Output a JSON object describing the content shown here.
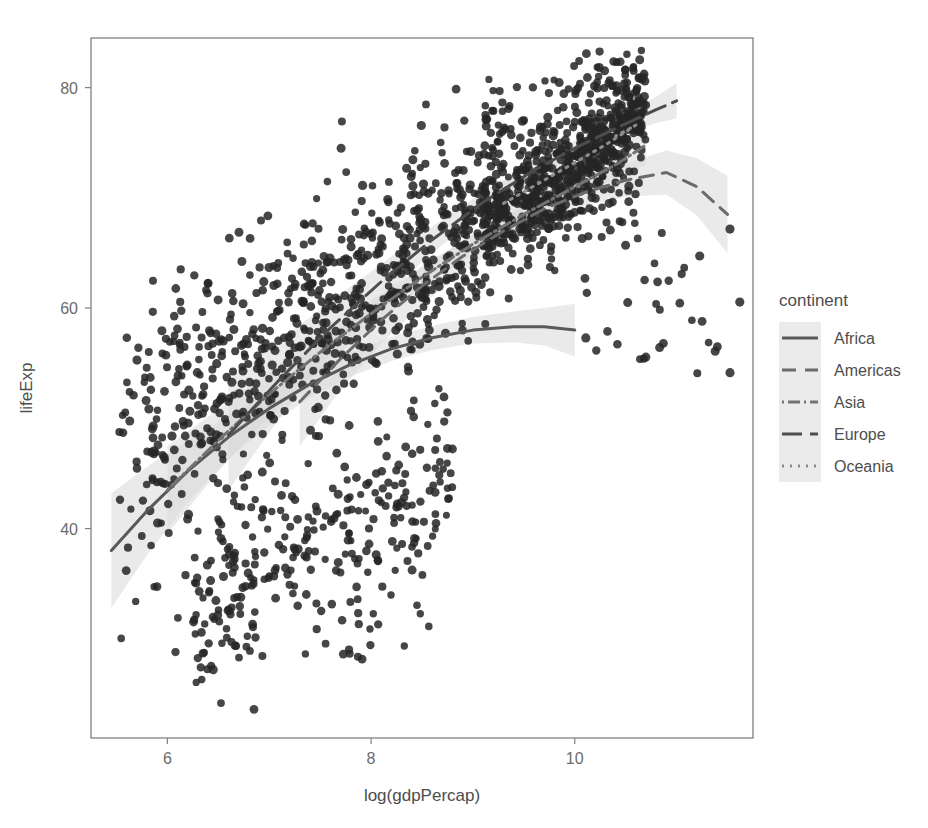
{
  "chart_data": {
    "type": "scatter",
    "title": "",
    "subtitle": "",
    "xlabel": "log(gdpPercap)",
    "ylabel": "lifeExp",
    "xlim": [
      5.25,
      11.75
    ],
    "ylim": [
      21.0,
      84.5
    ],
    "xticks": [
      6,
      8,
      10
    ],
    "yticks": [
      40,
      60,
      80
    ],
    "xtick_labels": [
      "6",
      "8",
      "10"
    ],
    "ytick_labels": [
      "40",
      "60",
      "80"
    ],
    "grid": false,
    "panel_background": "#ffffff",
    "panel_border_color": "#808080",
    "point_color": "#262626",
    "point_size": 7,
    "point_opacity": 0.85,
    "ribbon_color": "#d9d9d9",
    "ribbon_opacity": 0.55,
    "legend": {
      "title": "continent",
      "position": "right",
      "entries": [
        {
          "label": "Africa",
          "linetype": "solid",
          "dasharray": "none",
          "color": "#595959"
        },
        {
          "label": "Americas",
          "linetype": "dashed",
          "dasharray": "14,9",
          "color": "#6b6b6b"
        },
        {
          "label": "Asia",
          "linetype": "dotdash",
          "dasharray": "2,4,12,4",
          "color": "#737373"
        },
        {
          "label": "Europe",
          "linetype": "longdash",
          "dasharray": "20,8",
          "color": "#4d4d4d"
        },
        {
          "label": "Oceania",
          "linetype": "dotted",
          "dasharray": "2,6",
          "color": "#8c8c8c"
        }
      ]
    },
    "series": [
      {
        "name": "Africa",
        "linetype": "solid",
        "color": "#595959",
        "smooth": [
          {
            "x": 5.45,
            "y": 38.0,
            "lo": 32.8,
            "hi": 43.2
          },
          {
            "x": 5.8,
            "y": 41.6,
            "lo": 37.6,
            "hi": 45.6
          },
          {
            "x": 6.2,
            "y": 45.2,
            "lo": 42.4,
            "hi": 48.0
          },
          {
            "x": 6.6,
            "y": 48.3,
            "lo": 46.3,
            "hi": 50.3
          },
          {
            "x": 7.0,
            "y": 50.9,
            "lo": 49.4,
            "hi": 52.4
          },
          {
            "x": 7.4,
            "y": 53.1,
            "lo": 51.9,
            "hi": 54.3
          },
          {
            "x": 7.8,
            "y": 54.9,
            "lo": 53.8,
            "hi": 56.0
          },
          {
            "x": 8.2,
            "y": 56.3,
            "lo": 55.2,
            "hi": 57.4
          },
          {
            "x": 8.6,
            "y": 57.3,
            "lo": 56.2,
            "hi": 58.4
          },
          {
            "x": 9.0,
            "y": 58.0,
            "lo": 56.8,
            "hi": 59.2
          },
          {
            "x": 9.4,
            "y": 58.3,
            "lo": 56.9,
            "hi": 59.7
          },
          {
            "x": 9.7,
            "y": 58.3,
            "lo": 56.6,
            "hi": 60.0
          },
          {
            "x": 10.0,
            "y": 58.0,
            "lo": 55.6,
            "hi": 60.4
          }
        ]
      },
      {
        "name": "Americas",
        "linetype": "dashed",
        "color": "#6b6b6b",
        "smooth": [
          {
            "x": 7.3,
            "y": 51.5,
            "lo": 47.5,
            "hi": 55.5
          },
          {
            "x": 7.7,
            "y": 55.4,
            "lo": 52.6,
            "hi": 58.2
          },
          {
            "x": 8.1,
            "y": 58.9,
            "lo": 56.8,
            "hi": 61.0
          },
          {
            "x": 8.5,
            "y": 62.0,
            "lo": 60.3,
            "hi": 63.7
          },
          {
            "x": 8.9,
            "y": 64.7,
            "lo": 63.3,
            "hi": 66.1
          },
          {
            "x": 9.3,
            "y": 67.0,
            "lo": 65.8,
            "hi": 68.2
          },
          {
            "x": 9.7,
            "y": 69.0,
            "lo": 67.9,
            "hi": 70.1
          },
          {
            "x": 10.1,
            "y": 70.5,
            "lo": 69.3,
            "hi": 71.7
          },
          {
            "x": 10.5,
            "y": 71.6,
            "lo": 70.1,
            "hi": 73.1
          },
          {
            "x": 10.9,
            "y": 72.3,
            "lo": 70.3,
            "hi": 74.3
          },
          {
            "x": 11.2,
            "y": 71.0,
            "lo": 68.4,
            "hi": 73.6
          },
          {
            "x": 11.5,
            "y": 68.5,
            "lo": 65.0,
            "hi": 72.0
          }
        ]
      },
      {
        "name": "Asia",
        "linetype": "dotdash",
        "color": "#737373",
        "smooth": [
          {
            "x": 6.0,
            "y": 43.5,
            "lo": 39.5,
            "hi": 47.5
          },
          {
            "x": 6.5,
            "y": 48.0,
            "lo": 45.2,
            "hi": 50.8
          },
          {
            "x": 7.0,
            "y": 52.2,
            "lo": 50.2,
            "hi": 54.2
          },
          {
            "x": 7.5,
            "y": 56.0,
            "lo": 54.5,
            "hi": 57.5
          },
          {
            "x": 8.0,
            "y": 59.5,
            "lo": 58.3,
            "hi": 60.7
          },
          {
            "x": 8.5,
            "y": 62.8,
            "lo": 61.8,
            "hi": 63.8
          },
          {
            "x": 9.0,
            "y": 65.8,
            "lo": 64.9,
            "hi": 66.7
          },
          {
            "x": 9.5,
            "y": 68.5,
            "lo": 67.6,
            "hi": 69.4
          },
          {
            "x": 10.0,
            "y": 71.0,
            "lo": 70.0,
            "hi": 72.0
          },
          {
            "x": 10.4,
            "y": 73.0,
            "lo": 71.7,
            "hi": 74.3
          },
          {
            "x": 10.7,
            "y": 74.8,
            "lo": 73.0,
            "hi": 76.6
          }
        ]
      },
      {
        "name": "Europe",
        "linetype": "longdash",
        "color": "#4d4d4d",
        "smooth": [
          {
            "x": 6.6,
            "y": 48.5,
            "lo": 43.5,
            "hi": 53.5
          },
          {
            "x": 7.1,
            "y": 53.5,
            "lo": 50.0,
            "hi": 57.0
          },
          {
            "x": 7.6,
            "y": 58.2,
            "lo": 55.8,
            "hi": 60.6
          },
          {
            "x": 8.1,
            "y": 62.4,
            "lo": 60.8,
            "hi": 64.0
          },
          {
            "x": 8.6,
            "y": 66.2,
            "lo": 65.0,
            "hi": 67.4
          },
          {
            "x": 9.1,
            "y": 69.6,
            "lo": 68.7,
            "hi": 70.5
          },
          {
            "x": 9.6,
            "y": 72.5,
            "lo": 71.7,
            "hi": 73.3
          },
          {
            "x": 10.0,
            "y": 74.5,
            "lo": 73.8,
            "hi": 75.2
          },
          {
            "x": 10.4,
            "y": 76.3,
            "lo": 75.5,
            "hi": 77.1
          },
          {
            "x": 10.8,
            "y": 78.0,
            "lo": 76.8,
            "hi": 79.2
          },
          {
            "x": 11.0,
            "y": 78.8,
            "lo": 77.2,
            "hi": 80.4
          }
        ]
      },
      {
        "name": "Oceania",
        "linetype": "dotted",
        "color": "#8c8c8c",
        "smooth": [
          {
            "x": 9.3,
            "y": 69.5,
            "lo": 67.5,
            "hi": 71.5
          },
          {
            "x": 9.7,
            "y": 71.6,
            "lo": 70.4,
            "hi": 72.8
          },
          {
            "x": 10.0,
            "y": 73.2,
            "lo": 72.3,
            "hi": 74.1
          },
          {
            "x": 10.3,
            "y": 74.8,
            "lo": 74.0,
            "hi": 75.6
          },
          {
            "x": 10.6,
            "y": 76.6,
            "lo": 75.7,
            "hi": 77.5
          },
          {
            "x": 10.4,
            "y": 75.6,
            "lo": 74.8,
            "hi": 76.4
          }
        ]
      }
    ],
    "point_cloud_description": "1704 country-year observations of life expectancy against log GDP per capita, positively correlated, wide vertical spread at low GDP, tight high cluster at top right, several low-lifeExp outliers at mid and high GDP.",
    "notable_points": [
      {
        "x": 6.85,
        "y": 23.6,
        "note": "lowest lifeExp outlier"
      },
      {
        "x": 11.4,
        "y": 56.5,
        "note": "high gdp low lifeExp outlier"
      },
      {
        "x": 11.25,
        "y": 58.8,
        "note": "high gdp low lifeExp outlier"
      },
      {
        "x": 10.1,
        "y": 62.7,
        "note": "mid-high gdp outlier"
      }
    ]
  }
}
